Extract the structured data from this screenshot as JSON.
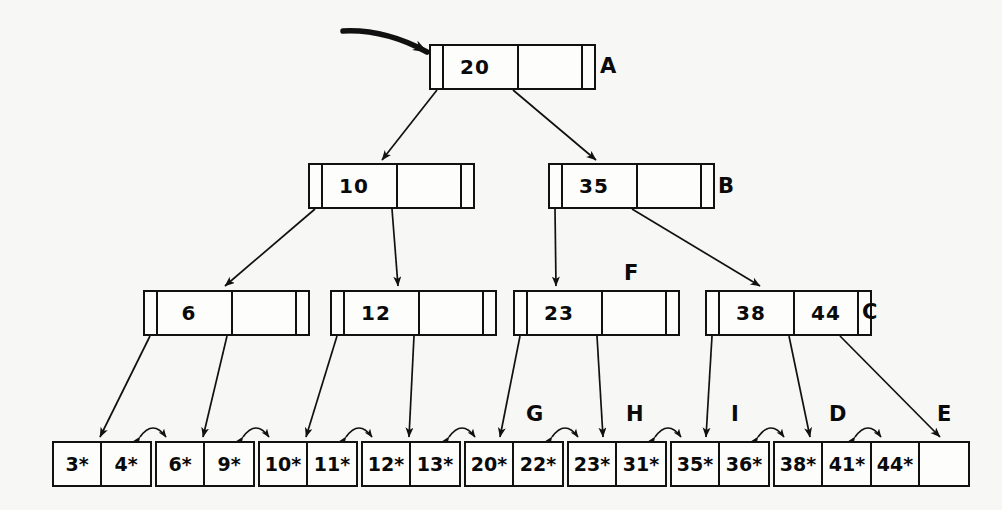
{
  "diagram": {
    "colors": {
      "ink": "#111111",
      "paper": "#f7f7f5",
      "node_fill": "#fdfdfb"
    },
    "root_entry_arrow": "root-pointer-arrow"
  },
  "levels": {
    "root": {
      "nodes": [
        {
          "id": "A",
          "label": "A",
          "x": 429,
          "y": 44,
          "keys": [
            "20",
            ""
          ],
          "slots": 2
        }
      ]
    },
    "level2": {
      "nodes": [
        {
          "id": "B_left",
          "label": "",
          "x": 308,
          "y": 163,
          "keys": [
            "10",
            ""
          ],
          "slots": 2
        },
        {
          "id": "B",
          "label": "B",
          "x": 548,
          "y": 163,
          "keys": [
            "35",
            ""
          ],
          "slots": 2
        }
      ]
    },
    "level3": {
      "nodes": [
        {
          "id": "L3_1",
          "label": "",
          "x": 143,
          "y": 290,
          "keys": [
            "6",
            ""
          ],
          "slots": 2
        },
        {
          "id": "L3_2",
          "label": "",
          "x": 330,
          "y": 290,
          "keys": [
            "12",
            ""
          ],
          "slots": 2
        },
        {
          "id": "F",
          "label": "F",
          "x": 513,
          "y": 290,
          "keys": [
            "23",
            ""
          ],
          "slots": 2
        },
        {
          "id": "C",
          "label": "C",
          "x": 705,
          "y": 290,
          "keys": [
            "38",
            "44"
          ],
          "slots": 2
        }
      ]
    },
    "leaves": {
      "nodes": [
        {
          "id": "leaf1",
          "label": "",
          "x": 52,
          "y": 441,
          "cells": [
            "3*",
            "4*"
          ]
        },
        {
          "id": "leaf2",
          "label": "",
          "x": 155,
          "y": 441,
          "cells": [
            "6*",
            "9*"
          ]
        },
        {
          "id": "leaf3",
          "label": "",
          "x": 258,
          "y": 441,
          "cells": [
            "10*",
            "11*"
          ]
        },
        {
          "id": "leaf4",
          "label": "",
          "x": 361,
          "y": 441,
          "cells": [
            "12*",
            "13*"
          ]
        },
        {
          "id": "G",
          "label": "G",
          "x": 464,
          "y": 441,
          "cells": [
            "20*",
            "22*"
          ]
        },
        {
          "id": "H",
          "label": "H",
          "x": 567,
          "y": 441,
          "cells": [
            "23*",
            "31*"
          ]
        },
        {
          "id": "I",
          "label": "I",
          "x": 670,
          "y": 441,
          "cells": [
            "35*",
            "36*"
          ]
        },
        {
          "id": "D",
          "label": "D",
          "x": 773,
          "y": 441,
          "cells": [
            "38*",
            "41*"
          ]
        },
        {
          "id": "E",
          "label": "E",
          "x": 870,
          "y": 441,
          "cells": [
            "44*",
            ""
          ]
        }
      ]
    }
  },
  "labels": [
    {
      "text": "A",
      "x": 600,
      "y": 56
    },
    {
      "text": "B",
      "x": 718,
      "y": 176
    },
    {
      "text": "F",
      "x": 624,
      "y": 263
    },
    {
      "text": "C",
      "x": 862,
      "y": 302
    },
    {
      "text": "G",
      "x": 526,
      "y": 404
    },
    {
      "text": "H",
      "x": 626,
      "y": 404
    },
    {
      "text": "I",
      "x": 731,
      "y": 404
    },
    {
      "text": "D",
      "x": 829,
      "y": 404
    },
    {
      "text": "E",
      "x": 937,
      "y": 404
    }
  ],
  "edges": {
    "tree_edges": [
      {
        "from": "A.p0",
        "to": "B_left.top",
        "x1": 437,
        "y1": 90,
        "x2": 382,
        "y2": 160
      },
      {
        "from": "A.p1",
        "to": "B.top",
        "x1": 513,
        "y1": 90,
        "x2": 596,
        "y2": 160
      },
      {
        "from": "B_left.p0",
        "to": "L3_1.top",
        "x1": 315,
        "y1": 209,
        "x2": 225,
        "y2": 286
      },
      {
        "from": "B_left.p1",
        "to": "L3_2.top",
        "x1": 392,
        "y1": 209,
        "x2": 398,
        "y2": 286
      },
      {
        "from": "B.p0",
        "to": "F.top",
        "x1": 555,
        "y1": 209,
        "x2": 556,
        "y2": 286
      },
      {
        "from": "B.p1",
        "to": "C.top",
        "x1": 632,
        "y1": 209,
        "x2": 760,
        "y2": 286
      },
      {
        "from": "L3_1.p0",
        "to": "leaf1.top",
        "x1": 150,
        "y1": 336,
        "x2": 100,
        "y2": 437
      },
      {
        "from": "L3_1.p1",
        "to": "leaf2.top",
        "x1": 227,
        "y1": 336,
        "x2": 203,
        "y2": 437
      },
      {
        "from": "L3_2.p0",
        "to": "leaf3.top",
        "x1": 337,
        "y1": 336,
        "x2": 306,
        "y2": 437
      },
      {
        "from": "L3_2.p1",
        "to": "leaf4.top",
        "x1": 414,
        "y1": 336,
        "x2": 409,
        "y2": 437
      },
      {
        "from": "F.p0",
        "to": "G.top",
        "x1": 520,
        "y1": 336,
        "x2": 500,
        "y2": 437
      },
      {
        "from": "F.p1",
        "to": "H.top",
        "x1": 597,
        "y1": 336,
        "x2": 603,
        "y2": 437
      },
      {
        "from": "C.p0",
        "to": "I.top",
        "x1": 712,
        "y1": 336,
        "x2": 706,
        "y2": 437
      },
      {
        "from": "C.p1",
        "to": "D.top",
        "x1": 789,
        "y1": 336,
        "x2": 810,
        "y2": 437
      },
      {
        "from": "C.p2",
        "to": "E.top",
        "x1": 840,
        "y1": 336,
        "x2": 940,
        "y2": 437
      }
    ],
    "leaf_chain_links": [
      {
        "from": "leaf1",
        "to": "leaf2",
        "x1": 140,
        "x2": 166
      },
      {
        "from": "leaf2",
        "to": "leaf3",
        "x1": 243,
        "x2": 269
      },
      {
        "from": "leaf3",
        "to": "leaf4",
        "x1": 346,
        "x2": 372
      },
      {
        "from": "leaf4",
        "to": "G",
        "x1": 449,
        "x2": 475
      },
      {
        "from": "G",
        "to": "H",
        "x1": 552,
        "x2": 578
      },
      {
        "from": "H",
        "to": "I",
        "x1": 655,
        "x2": 681
      },
      {
        "from": "I",
        "to": "D",
        "x1": 758,
        "x2": 784
      },
      {
        "from": "D",
        "to": "E",
        "x1": 855,
        "x2": 881
      }
    ],
    "root_arrow": {
      "x1": 343,
      "y1": 31,
      "x2": 427,
      "y2": 52
    }
  }
}
